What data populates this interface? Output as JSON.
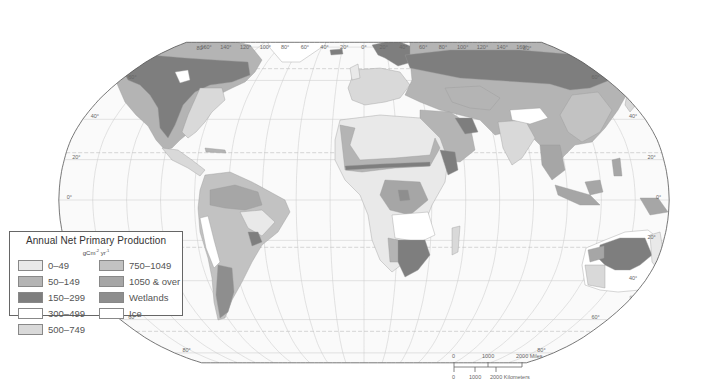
{
  "map": {
    "projection": "Robinson",
    "longitude_labels": [
      "160°",
      "140°",
      "120°",
      "100°",
      "80°",
      "60°",
      "40°",
      "20°",
      "0°",
      "20°",
      "40°",
      "60°",
      "80°",
      "100°",
      "120°",
      "140°",
      "160°"
    ],
    "latitude_labels_left": [
      "60°",
      "40°",
      "20°",
      "0°",
      "20°",
      "40°",
      "60°",
      "80°"
    ],
    "latitude_labels_right": [
      "60°",
      "40°",
      "20°",
      "0°",
      "20°",
      "40°",
      "60°",
      "80°"
    ],
    "top_lat_label_left": "80°",
    "top_lat_label_right": "80°"
  },
  "legend": {
    "title": "Annual Net Primary Production",
    "unit_base": "gCm",
    "unit_exp1": "-2",
    "unit_mid": " yr",
    "unit_exp2": "-1",
    "classes": [
      {
        "label": "0–49",
        "color": "#e9e9e9"
      },
      {
        "label": "50–149",
        "color": "#b4b4b4"
      },
      {
        "label": "150–299",
        "color": "#7e7e7e"
      },
      {
        "label": "300–499",
        "color": "#ffffff"
      },
      {
        "label": "500–749",
        "color": "#d9d9d9"
      },
      {
        "label": "750–1049",
        "color": "#c2c2c2"
      },
      {
        "label": "1050 & over",
        "color": "#a6a6a6"
      },
      {
        "label": "Wetlands",
        "color": "#8e8e8e"
      },
      {
        "label": "Ice",
        "color": "#ffffff"
      }
    ]
  },
  "scale_bar": {
    "miles_labels": [
      "0",
      "1000",
      "2000 Miles"
    ],
    "km_labels": [
      "0",
      "1000",
      "2000 Kilometers"
    ]
  },
  "colors": {
    "ocean": "#fafafa",
    "graticule": "#c8c8c8",
    "tropics": "#bdbdbd",
    "outline": "#555555"
  }
}
